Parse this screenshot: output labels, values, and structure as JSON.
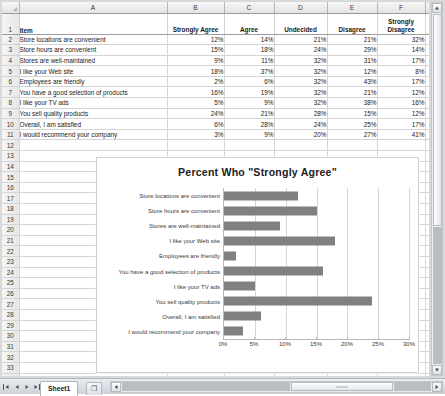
{
  "app": {
    "sheet_tab": "Sheet1",
    "new_sheet_label": "❐",
    "corner_name": "select-all"
  },
  "columns": {
    "headers": [
      "A",
      "B",
      "C",
      "D",
      "E",
      "F",
      "G"
    ]
  },
  "table": {
    "header_row_number": "1",
    "headers": [
      "Item",
      "Strongly Agree",
      "Agree",
      "Undecided",
      "Disagree",
      "Strongly Disagree"
    ],
    "rows": [
      {
        "n": "2",
        "item": "Store locations are convenient",
        "sa": "12%",
        "a": "14%",
        "u": "21%",
        "d": "21%",
        "sd": "32%"
      },
      {
        "n": "3",
        "item": "Store hours are convenient",
        "sa": "15%",
        "a": "18%",
        "u": "24%",
        "d": "29%",
        "sd": "14%"
      },
      {
        "n": "4",
        "item": "Stores are well-maintained",
        "sa": "9%",
        "a": "11%",
        "u": "32%",
        "d": "31%",
        "sd": "17%"
      },
      {
        "n": "5",
        "item": "I like your Web site",
        "sa": "18%",
        "a": "37%",
        "u": "32%",
        "d": "12%",
        "sd": "8%"
      },
      {
        "n": "6",
        "item": "Employees are friendly",
        "sa": "2%",
        "a": "6%",
        "u": "32%",
        "d": "43%",
        "sd": "17%"
      },
      {
        "n": "7",
        "item": "You have a good selection of products",
        "sa": "16%",
        "a": "19%",
        "u": "32%",
        "d": "21%",
        "sd": "12%"
      },
      {
        "n": "8",
        "item": "I like your TV ads",
        "sa": "5%",
        "a": "9%",
        "u": "32%",
        "d": "38%",
        "sd": "16%"
      },
      {
        "n": "9",
        "item": "You sell quality products",
        "sa": "24%",
        "a": "21%",
        "u": "28%",
        "d": "15%",
        "sd": "12%"
      },
      {
        "n": "10",
        "item": "Overall, I am satisfied",
        "sa": "6%",
        "a": "28%",
        "u": "24%",
        "d": "25%",
        "sd": "17%"
      },
      {
        "n": "11",
        "item": "I would recommend your company",
        "sa": "3%",
        "a": "9%",
        "u": "20%",
        "d": "27%",
        "sd": "41%"
      }
    ],
    "blank_row_numbers": [
      "12",
      "13",
      "14",
      "15",
      "16",
      "17",
      "18",
      "19",
      "20",
      "21",
      "22",
      "23",
      "24",
      "25",
      "26",
      "27",
      "28",
      "29",
      "30",
      "31",
      "32",
      "33",
      "34"
    ]
  },
  "chart_data": {
    "type": "bar",
    "orientation": "horizontal",
    "title": "Percent Who \"Strongly Agree\"",
    "xlabel": "",
    "ylabel": "",
    "categories": [
      "Store locations are convenient",
      "Store hours are convenient",
      "Stores are well-maintained",
      "I like your Web site",
      "Employees are friendly",
      "You have a good selection of products",
      "I like your TV ads",
      "You sell quality products",
      "Overall, I am satisfied",
      "I would recommend your company"
    ],
    "values": [
      12,
      15,
      9,
      18,
      2,
      16,
      5,
      24,
      6,
      3
    ],
    "xlim": [
      0,
      30
    ],
    "xtick_labels": [
      "0%",
      "5%",
      "10%",
      "15%",
      "20%",
      "25%",
      "30%"
    ],
    "xtick_values": [
      0,
      5,
      10,
      15,
      20,
      25,
      30
    ],
    "grid": true,
    "legend": false,
    "bar_color": "#808080"
  }
}
